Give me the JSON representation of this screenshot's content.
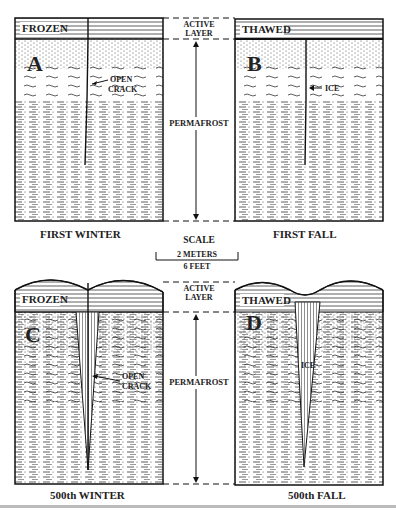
{
  "diagram": {
    "panels": [
      {
        "id": "A",
        "letter": "A",
        "surface_label": "FROZEN",
        "crack_label_1": "OPEN",
        "crack_label_2": "CRACK",
        "caption": "FIRST WINTER"
      },
      {
        "id": "B",
        "letter": "B",
        "surface_label": "THAWED",
        "crack_label_1": "ICE",
        "caption": "FIRST FALL"
      },
      {
        "id": "C",
        "letter": "C",
        "surface_label": "FROZEN",
        "crack_label_1": "OPEN",
        "crack_label_2": "CRACK",
        "caption": "500th WINTER"
      },
      {
        "id": "D",
        "letter": "D",
        "surface_label": "THAWED",
        "crack_label_1": "ICE",
        "caption": "500th FALL"
      }
    ],
    "center_top": {
      "active_1": "ACTIVE",
      "active_2": "LAYER",
      "permafrost": "PERMAFROST"
    },
    "center_bottom": {
      "active_1": "ACTIVE",
      "active_2": "LAYER",
      "permafrost": "PERMAFROST"
    },
    "scale": {
      "title": "SCALE",
      "metric": "2 METERS",
      "imperial": "6 FEET"
    }
  }
}
